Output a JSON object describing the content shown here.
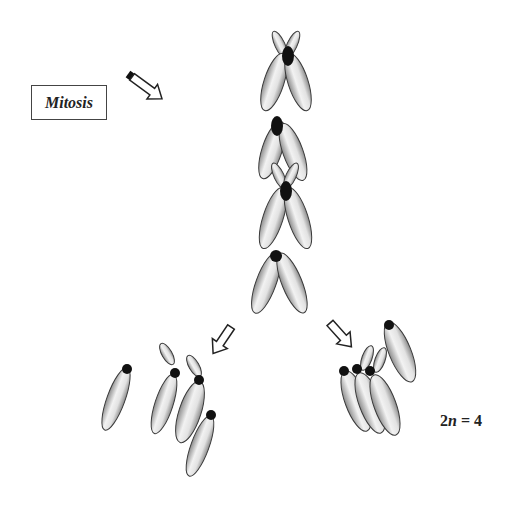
{
  "diagram": {
    "title_box": {
      "label": "Mitosis"
    },
    "ploidy_label": {
      "prefix": "2",
      "variable": "n",
      "suffix": " = 4"
    },
    "stages": [
      {
        "name": "metaphase-chromosome-1",
        "description": "Replicated chromosome (X shape) with shared centromere"
      },
      {
        "name": "metaphase-chromosome-2",
        "description": "Replicated chromosome with shared centromere"
      },
      {
        "name": "metaphase-chromosome-3",
        "description": "Replicated chromosome (X shape) with shared centromere"
      },
      {
        "name": "metaphase-chromosome-4",
        "description": "Replicated chromosome with shared centromere"
      }
    ],
    "daughter_cells": [
      {
        "name": "left-daughter-set",
        "chromosome_count": 4
      },
      {
        "name": "right-daughter-set",
        "chromosome_count": 4
      }
    ],
    "arrows": [
      {
        "name": "mitosis-arrow",
        "direction": "down-right"
      },
      {
        "name": "left-split-arrow",
        "direction": "down-left"
      },
      {
        "name": "right-split-arrow",
        "direction": "down-right"
      }
    ],
    "colors": {
      "chromatid_fill_center": "#f4f4f4",
      "chromatid_fill_edge": "#8a8a8a",
      "chromatid_stroke": "#3a3a3a",
      "centromere": "#111111",
      "arrow_stroke": "#222222"
    }
  }
}
